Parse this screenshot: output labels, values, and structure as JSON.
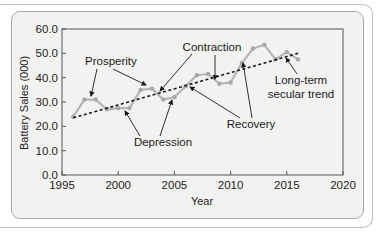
{
  "chart_data": {
    "type": "line",
    "title": "",
    "xlabel": "Year",
    "ylabel": "Battery Sales (000)",
    "xlim": [
      1995,
      2020
    ],
    "ylim": [
      0,
      60
    ],
    "x_ticks": [
      "1995",
      "2000",
      "2005",
      "2010",
      "2015",
      "2020"
    ],
    "y_ticks": [
      "0.0",
      "10.0",
      "20.0",
      "30.0",
      "40.0",
      "50.0",
      "60.0"
    ],
    "grid": false,
    "series": [
      {
        "name": "Battery Sales",
        "style": "solid grey line with markers",
        "x": [
          1996,
          1997,
          1998,
          1999,
          2000,
          2001,
          2002,
          2003,
          2004,
          2005,
          2006,
          2007,
          2008,
          2009,
          2010,
          2011,
          2012,
          2013,
          2014,
          2015,
          2016
        ],
        "values": [
          24.0,
          31.0,
          31.0,
          27.0,
          27.5,
          27.5,
          35.0,
          35.5,
          31.0,
          32.0,
          36.5,
          41.0,
          41.5,
          37.5,
          38.0,
          46.0,
          52.0,
          53.5,
          47.5,
          50.5,
          47.5
        ]
      },
      {
        "name": "Long-term secular trend",
        "style": "dashed black line",
        "x": [
          1996,
          2016
        ],
        "values": [
          23.5,
          50.0
        ]
      }
    ],
    "annotations": [
      {
        "text": "Prosperity",
        "points_to": [
          [
            1997.5,
            31.0
          ],
          [
            2003,
            35.5
          ]
        ]
      },
      {
        "text": "Contraction",
        "points_to": [
          [
            2004,
            33.5
          ],
          [
            2009,
            39.5
          ]
        ]
      },
      {
        "text": "Depression",
        "points_to": [
          [
            2001,
            28.5
          ],
          [
            2005,
            33.0
          ]
        ]
      },
      {
        "text": "Recovery",
        "points_to": [
          [
            2006.5,
            36.5
          ],
          [
            2011,
            45.0
          ]
        ]
      },
      {
        "text": "Long-term\nsecular trend",
        "points_to": [
          [
            2015,
            49.5
          ]
        ]
      }
    ],
    "legend": "none"
  },
  "labels": {
    "ylabel": "Battery Sales (000)",
    "xlabel": "Year",
    "prosperity": "Prosperity",
    "contraction": "Contraction",
    "depression": "Depression",
    "recovery": "Recovery",
    "trend_line1": "Long-term",
    "trend_line2": "secular trend"
  },
  "colors": {
    "series_line": "#b5b5b5",
    "trend_line": "#1a1a1a",
    "panel_bg": "#f2f2f1",
    "axis": "#555555"
  }
}
